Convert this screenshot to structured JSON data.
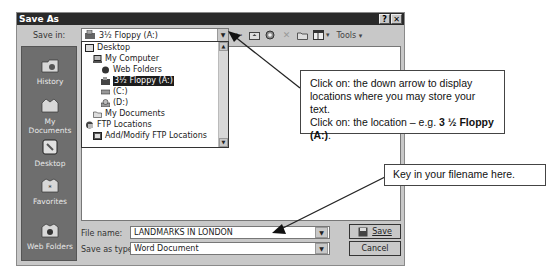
{
  "dialog": {
    "title": "Save As",
    "help_btn": "?",
    "close_btn": "✕"
  },
  "save_in": {
    "label": "Save in:",
    "value": "3½ Floppy (A:)"
  },
  "toolbar": {
    "items": [
      "back-icon",
      "up-folder-icon",
      "search-web-icon",
      "delete-icon",
      "new-folder-icon",
      "views-icon"
    ],
    "tools_label": "Tools",
    "tools_arrow": "▾",
    "views_arrow": "▾"
  },
  "places": [
    {
      "label": "History",
      "icon": "history-icon"
    },
    {
      "label": "My Documents",
      "icon": "my-documents-icon"
    },
    {
      "label": "Desktop",
      "icon": "desktop-icon"
    },
    {
      "label": "Favorites",
      "icon": "favorites-icon"
    },
    {
      "label": "Web Folders",
      "icon": "web-folders-icon"
    }
  ],
  "dropdown": {
    "items": [
      {
        "label": "Desktop",
        "indent": 0,
        "icon": "desktop-icon",
        "selected": false
      },
      {
        "label": "My Computer",
        "indent": 1,
        "icon": "computer-icon",
        "selected": false
      },
      {
        "label": "Web Folders",
        "indent": 2,
        "icon": "web-folders-icon",
        "selected": false
      },
      {
        "label": "3½ Floppy (A:)",
        "indent": 2,
        "icon": "floppy-icon",
        "selected": true
      },
      {
        "label": "(C:)",
        "indent": 2,
        "icon": "hard-drive-icon",
        "selected": false
      },
      {
        "label": "(D:)",
        "indent": 2,
        "icon": "cd-drive-icon",
        "selected": false
      },
      {
        "label": "My Documents",
        "indent": 1,
        "icon": "folder-icon",
        "selected": false
      },
      {
        "label": "FTP Locations",
        "indent": 0,
        "icon": "ftp-icon",
        "selected": false
      },
      {
        "label": "Add/Modify FTP Locations",
        "indent": 1,
        "icon": "ftp-add-icon",
        "selected": false
      }
    ]
  },
  "file_name": {
    "label": "File name:",
    "value": "LANDMARKS IN LONDON"
  },
  "save_as_type": {
    "label": "Save as type:",
    "value": "Word Document"
  },
  "buttons": {
    "save": "Save",
    "cancel": "Cancel"
  },
  "callouts": {
    "top": {
      "line1": "Click on: the down arrow to display",
      "line2": "locations where you may store your text.",
      "line3_prefix": "Click on: the location – e.g. ",
      "line3_bold": "3 ½ Floppy",
      "line4_bold": "(A:)",
      "line4_suffix": "."
    },
    "bottom": {
      "text": "Key in your filename here."
    }
  },
  "colors": {
    "titlebar": "#2a2a2a",
    "dialog_bg": "#c8c8c8",
    "places_bg": "#6e6e6e",
    "selection": "#1c1c1c"
  }
}
